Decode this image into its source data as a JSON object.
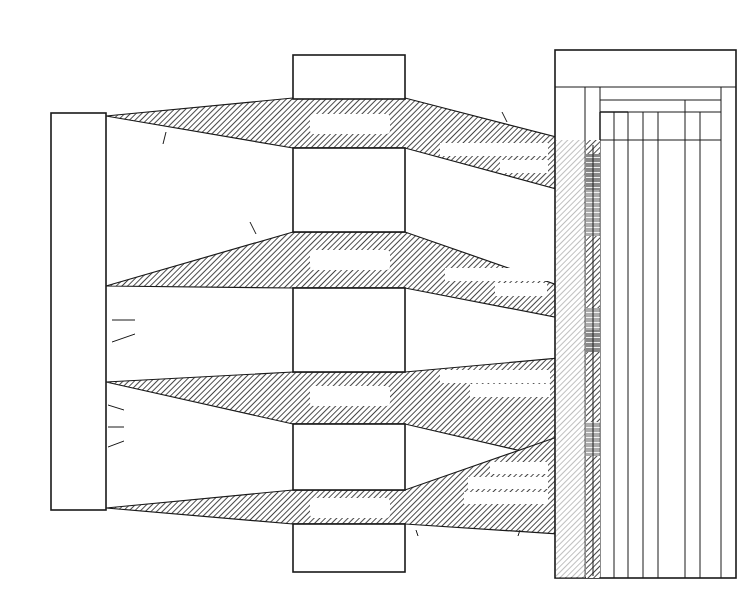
{
  "titles": {
    "left": [
      "MIOCENE",
      "SEQUENCE",
      "STRATIGRAPHY"
    ],
    "center": [
      "BIOCHRONOSTRATIGRAPHIC",
      "SUBDIVISIONS"
    ],
    "right": [
      "GEOCHRONOLOGICAL",
      "FRAMEWORK"
    ],
    "bottom_left": [
      "RELATIVE",
      "CHRONOSTRATIGRAPHIC",
      "FRAMEWORK"
    ],
    "bottom_right": [
      "MIOCENE SEQUENCE STRATIGRAPHY",
      "OF NORTH CAROLINA",
      "PLOTTED AGAINST ABSOLUTE TIME"
    ]
  },
  "sequence_column": {
    "items": [
      {
        "type": "unconf",
        "label": "ρ"
      },
      {
        "type": "seq",
        "label": "BBS-8"
      },
      {
        "type": "unconf",
        "label": "λ8"
      },
      {
        "type": "seq",
        "label": "BBS-7"
      },
      {
        "type": "unconf",
        "label": "λ7"
      },
      {
        "type": "seq",
        "label": "BBS-6"
      },
      {
        "type": "unconf",
        "label": "λ6"
      },
      {
        "type": "seq",
        "label": "BBS-5"
      },
      {
        "type": "unconf",
        "label": "λ5"
      },
      {
        "type": "seq",
        "label": "BBS-4"
      },
      {
        "type": "unconf",
        "label": "λ4"
      },
      {
        "type": "seq",
        "label": "BBS-3"
      },
      {
        "type": "unconf",
        "label": "λ3"
      },
      {
        "type": "seq",
        "label": "BBS-2"
      },
      {
        "type": "unconf",
        "label": "λ2"
      },
      {
        "type": "seq",
        "label": "BBS-1"
      },
      {
        "type": "unconf",
        "label": "λ1"
      },
      {
        "type": "seq",
        "label": "OBS-4"
      },
      {
        "type": "unconf",
        "label": "θ4"
      },
      {
        "type": "seq",
        "label": "OBS-3"
      },
      {
        "type": "unconf",
        "label": "θ3"
      },
      {
        "type": "seq",
        "label": "OBS-2"
      },
      {
        "type": "unconf",
        "label": "θ2"
      },
      {
        "type": "seq",
        "label": "OBS-1"
      },
      {
        "type": "unconf",
        "label": "θ1"
      },
      {
        "type": "seq",
        "label": "FPS-6"
      },
      {
        "type": "unconf",
        "label": "ε6"
      },
      {
        "type": "seq",
        "label": "FPS-5"
      },
      {
        "type": "unconf",
        "label": "ε5"
      },
      {
        "type": "seq",
        "label": "FPS-4"
      },
      {
        "type": "unconf",
        "label": "ε4"
      },
      {
        "type": "seq",
        "label": "FPS-3"
      },
      {
        "type": "unconf",
        "label": "ε3"
      },
      {
        "type": "seq",
        "label": "FPS-2"
      },
      {
        "type": "unconf",
        "label": "ε2"
      },
      {
        "type": "seq",
        "label": "FPS-1"
      },
      {
        "type": "unconf",
        "label": "ε1"
      }
    ]
  },
  "sections": {
    "zanclean": {
      "title": [
        "ZANCLEAN",
        "SECTION"
      ],
      "sub": "(UNDIFFERENTIATED)"
    },
    "serravallian": {
      "title": [
        "SERRAVALLIAN",
        "SECTION"
      ],
      "sub": [
        "(BOGUE BANKS",
        "SEQUENCES)"
      ]
    },
    "langhian": {
      "title": [
        "LANGHIAN",
        "SECTION"
      ],
      "sub": [
        "(ONSLOW BAY",
        "SEQUENCES)"
      ]
    },
    "burdigalian": {
      "title": [
        "MID-",
        "BURDIGALIAN",
        "SECTION"
      ],
      "sub": [
        "(FRYING PAN",
        "SEQUENCES)"
      ]
    },
    "chattian": {
      "title": [
        "LATE CHATTIAN",
        "SECTION"
      ],
      "sub": "(SILVERDALE SEQUENCES)"
    }
  },
  "hiatuses": [
    {
      "name": "HIATUS",
      "symbol": "ρ"
    },
    {
      "name": "HIATUS",
      "symbol": "λ",
      "sub": "1"
    },
    {
      "name": "HIATUS",
      "symbol": "θ",
      "sub": "1"
    },
    {
      "name": "HIATUS",
      "symbol": "ε",
      "sub": "1"
    }
  ],
  "annotations": {
    "time_gaps": [
      "TIME GAPS RECOGNIZED FROM",
      "ANALYSIS OF PLANKTIC",
      "MICROFOSSIL ASSEMBLAGES",
      "RECOVERED ACROSS",
      "DISCONTINUITY SURFACES"
    ],
    "physical": [
      "PHYSICAL UNCONFORMITY SURFACES",
      "EXTENDING ACROSS THE",
      "CONTINENTAL SHELF"
    ],
    "sequences": [
      "SEQUENCES",
      "BOUND BY",
      "BASIN-WIDE",
      "UNCONFORMITIES"
    ],
    "upper_boundary": [
      "UPPER BOUNDARY",
      "OF THIS HIATUS",
      "IS OFFSCALE ( ≈ 5.0 Ma*)"
    ],
    "strat_gap": [
      "STRATIGRAPHIC GAP",
      "≈ 6.4 Ma*"
    ],
    "serravallian_unc": [
      "SERRAVALLIAN",
      "UNCONFORMITIES"
    ],
    "missing_strata": [
      "MISSING STRATA",
      "≈ 1.6Ma*"
    ],
    "langhian_unc": [
      "LANGHIAN",
      "UNCONFORMITIES"
    ],
    "no_stratal": [
      "NO STRATAL RECORD",
      "FOR ≈ 2.2 Ma*"
    ],
    "burdigalian_unc": [
      "BURDIGALIAN",
      "UNCONFORMITIES"
    ],
    "no_shelf": [
      "NO SHELF",
      "STRATAL RECORD",
      "HIATUS ≈ 6.0Ma*"
    ],
    "lower_boundary": [
      "LOWER BOUNDARY",
      "OF THIS HIATUS",
      "IS OFFSCALE (≈ 24.8 Ma*)"
    ],
    "footnote": [
      "*NOTES THAT TIME ESTIMATES ARE RELATIVE ONLY TO",
      "THE CALIBRATED BIOGEOCHRONOLOGIC TIME-SCALE",
      "USED BY HAQ, HARDENBOL, AND VAIL (1987)."
    ]
  },
  "lambda_labels": [
    "λ8",
    "λ7",
    "λ6",
    "λ5",
    "λ4",
    "λ3",
    "λ2"
  ],
  "theta_labels": [
    "θ4",
    "θ3",
    "θ2"
  ],
  "epsilon_labels": [
    "ε6",
    "ε5",
    "ε4",
    "ε3",
    "ε2"
  ],
  "framework": {
    "col_seq_header": "SEQUENCES, HIATUSES, AND UNCONFORMITIES",
    "biochronology": "BIOCHRONOLOGY",
    "global": "GLOBAL BIOCHRONOZONES",
    "regional": "REGIONAL BIOCHRONS",
    "time_header": "TIME Ma",
    "col_headers": [
      "FORAMS (BLOW 1969)",
      "NANNOS (BUKRY)",
      "NANNOS (MARTINI)",
      "RADS (RIEDEL & SANFILIPPO)",
      "DIATOMS (NORTH PACIFIC)",
      "DIATOMS (ABBOTT 1980)"
    ],
    "forams": [
      "16",
      "N-14",
      "N-15",
      "N-13",
      "N-12",
      "N-11",
      "N-10",
      "9",
      "N-8",
      "N-7",
      "N-6",
      "N-5"
    ],
    "nannos_bukry": [
      "CN-6",
      "CN-7A",
      "CN-7B",
      "CN-5B",
      "CN-5A",
      "CN-4",
      "CN-3",
      "CN-2",
      "CN-1B",
      "CN-1C"
    ],
    "nannos_martini": [
      "NN-9",
      "NN-8",
      "NN-7",
      "NN-6",
      "NN-5",
      "NN-4",
      "NN-3",
      "NN-2",
      "NN-1"
    ],
    "rads": [
      "DIARTUS PETTERSSONI",
      "DORCADOSPYRIS ALATA",
      "CALOCYCLETTA COSTATA",
      "STICHOCORYS WOLFFII",
      "STICHOCORYS DELMONTENSIS"
    ],
    "diatoms_np": [
      "DENTICULOPSIS HUSTEDTII / DENTICULOPSIS LAUTA",
      "DENTICULOPSIS LAUTA",
      "A. INGENS",
      "THALASSIOSIRA FRAGA",
      "T. IGNAVA"
    ],
    "diatoms_abbott": [
      "DATUM, BUT NOT ZONED",
      "VI",
      "V",
      "IV",
      "III",
      "II",
      "NOT ZONED",
      "I",
      "DATUM, BUT NOT ZONED"
    ],
    "time_ticks": [
      "9",
      "10",
      "11",
      "12",
      "13",
      "14",
      "15",
      "16",
      "17",
      "18",
      "19",
      "20",
      "21"
    ]
  }
}
